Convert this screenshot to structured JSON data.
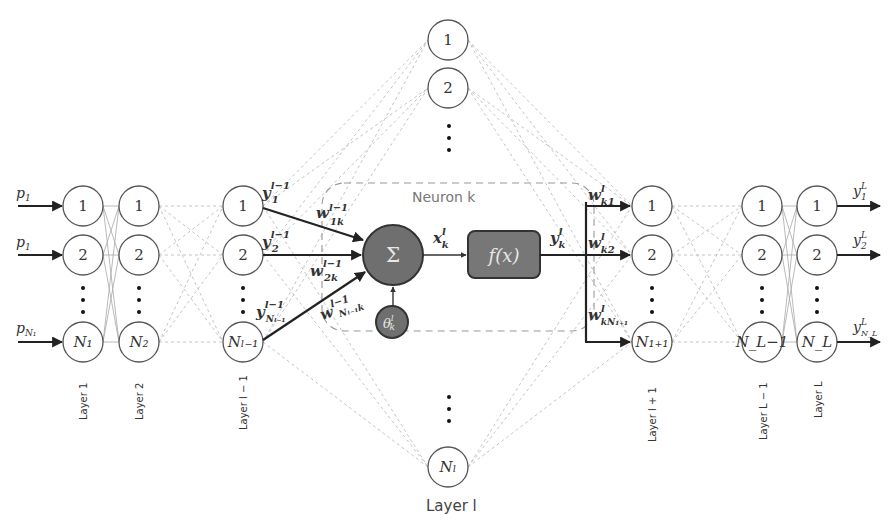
{
  "diagram": {
    "neuron_box_title": "Neuron k",
    "layer_l_title": "Layer l",
    "sum_symbol": "Σ",
    "activation_label": "f(x)",
    "bias_label": "θ",
    "bias_sup": "l",
    "bias_sub": "k",
    "inputs": [
      {
        "base": "p",
        "sub": "1"
      },
      {
        "base": "p",
        "sub": "1"
      },
      {
        "base": "p",
        "sub": "N₁"
      }
    ],
    "outputs": [
      {
        "base": "y",
        "sup": "L",
        "sub": "1"
      },
      {
        "base": "y",
        "sup": "L",
        "sub": "2"
      },
      {
        "base": "y",
        "sup": "L",
        "sub": "N_L"
      }
    ],
    "layers": [
      {
        "label": "Layer 1",
        "nodes": [
          "1",
          "2",
          "N₁"
        ]
      },
      {
        "label": "Layer 2",
        "nodes": [
          "1",
          "2",
          "N₂"
        ]
      },
      {
        "label": "Layer l − 1",
        "nodes": [
          "1",
          "2",
          "Nₗ₋₁"
        ]
      },
      {
        "label": "Layer l",
        "nodes": [
          "1",
          "2",
          "Nₗ"
        ]
      },
      {
        "label": "Layer l + 1",
        "nodes": [
          "1",
          "2",
          "N₁₊₁"
        ]
      },
      {
        "label": "Layer L − 1",
        "nodes": [
          "1",
          "2",
          "N_L−1"
        ]
      },
      {
        "label": "Layer L",
        "nodes": [
          "1",
          "2",
          "N_L"
        ]
      }
    ],
    "prev_outputs": [
      {
        "base": "y",
        "sup": "l−1",
        "sub": "1"
      },
      {
        "base": "y",
        "sup": "l−1",
        "sub": "2"
      },
      {
        "base": "y",
        "sup": "l−1",
        "sub": "Nₗ₋₁"
      }
    ],
    "in_weights": [
      {
        "base": "w",
        "sup": "l−1",
        "sub": "1k"
      },
      {
        "base": "w",
        "sup": "l−1",
        "sub": "2k"
      },
      {
        "base": "w",
        "sup": "l−1",
        "sub": "Nₗ₋₁k"
      }
    ],
    "net_input": {
      "base": "x",
      "sup": "l",
      "sub": "k"
    },
    "neuron_output": {
      "base": "y",
      "sup": "l",
      "sub": "k"
    },
    "out_weights": [
      {
        "base": "w",
        "sup": "l",
        "sub": "k1"
      },
      {
        "base": "w",
        "sup": "l",
        "sub": "k2"
      },
      {
        "base": "w",
        "sup": "l",
        "sub": "kN₁₊₁"
      }
    ]
  }
}
